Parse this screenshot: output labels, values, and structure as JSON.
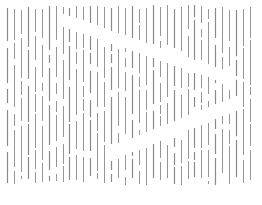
{
  "image": {
    "description": "Abstract pattern of vertical gray line segments with gaps forming a hidden shape",
    "line_color": "#8a8a8a",
    "background_color": "#ffffff",
    "column_count": 36
  }
}
